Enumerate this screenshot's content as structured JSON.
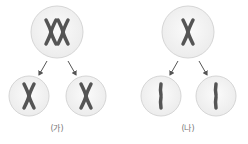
{
  "diagram": {
    "panels": [
      {
        "label": "(가)",
        "parent_cell": "cell with two replicated chromosome pairs (homologous pair, X-shaped)",
        "daughter_cells": [
          "cell with one replicated chromosome (X-shaped)",
          "cell with one replicated chromosome (X-shaped)"
        ],
        "process": "homologous chromosomes separate (meiosis I)"
      },
      {
        "label": "(나)",
        "parent_cell": "cell with one replicated chromosome (X-shaped)",
        "daughter_cells": [
          "cell with one single chromatid chromosome",
          "cell with one single chromatid chromosome"
        ],
        "process": "sister chromatids separate (meiosis II)"
      }
    ],
    "colors": {
      "cell_fill": "#f4f4f4",
      "cell_stroke": "#d6d6d6",
      "chromosome": "#555555",
      "arrow": "#555555",
      "label": "#777777"
    }
  }
}
